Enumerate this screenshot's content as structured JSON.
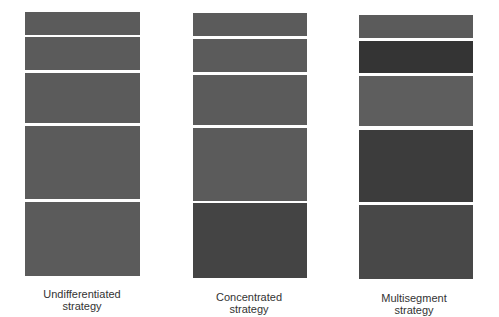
{
  "diagram": {
    "title": "",
    "columns": [
      {
        "label_line1": "Undifferentiated",
        "label_line2": "strategy",
        "segments": [
          {
            "top": 12,
            "bottom": 35,
            "color": "#5b5b5b"
          },
          {
            "top": 37,
            "bottom": 70,
            "color": "#5b5b5b"
          },
          {
            "top": 73,
            "bottom": 123,
            "color": "#5b5b5b"
          },
          {
            "top": 126,
            "bottom": 199,
            "color": "#5b5b5b"
          },
          {
            "top": 202,
            "bottom": 276,
            "color": "#5b5b5b"
          }
        ]
      },
      {
        "label_line1": "Concentrated",
        "label_line2": "strategy",
        "segments": [
          {
            "top": 13,
            "bottom": 36,
            "color": "#5b5b5b"
          },
          {
            "top": 39,
            "bottom": 72,
            "color": "#5b5b5b"
          },
          {
            "top": 75,
            "bottom": 125,
            "color": "#5b5b5b"
          },
          {
            "top": 128,
            "bottom": 201,
            "color": "#5b5b5b"
          },
          {
            "top": 203,
            "bottom": 278,
            "color": "#444444"
          }
        ]
      },
      {
        "label_line1": "Multisegment",
        "label_line2": "strategy",
        "segments": [
          {
            "top": 15,
            "bottom": 38,
            "color": "#5b5b5b"
          },
          {
            "top": 41,
            "bottom": 73,
            "color": "#343434"
          },
          {
            "top": 76,
            "bottom": 126,
            "color": "#5e5e5e"
          },
          {
            "top": 130,
            "bottom": 202,
            "color": "#3c3c3c"
          },
          {
            "top": 205,
            "bottom": 279,
            "color": "#484848"
          }
        ]
      }
    ]
  }
}
